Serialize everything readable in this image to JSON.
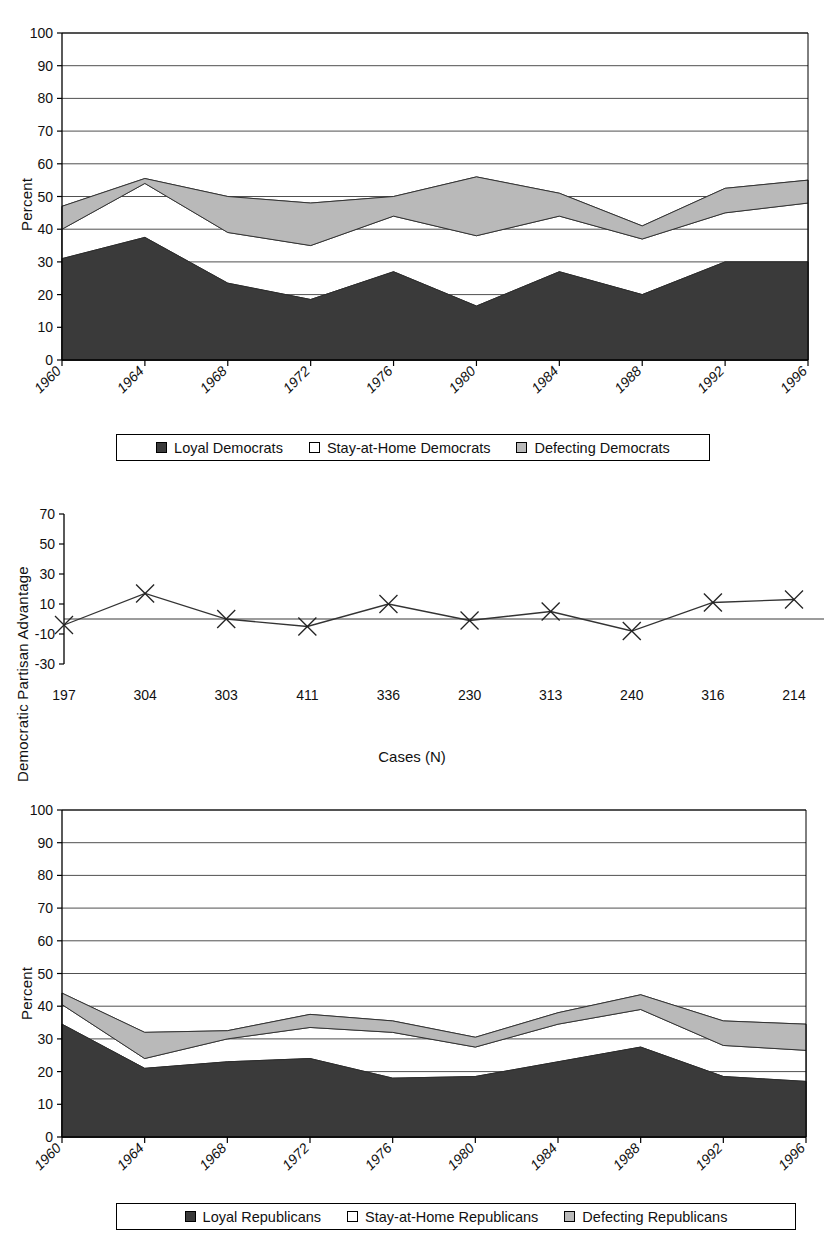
{
  "figure": {
    "background": "#ffffff",
    "colors": {
      "loyal": "#3a3a3a",
      "stay_at_home": "#ffffff",
      "defecting": "#b9b9b9",
      "axis": "#000000",
      "gridline": "#444444",
      "text": "#111111"
    }
  },
  "panel_democrats": {
    "y_axis_label": "Percent",
    "legend": {
      "items": [
        {
          "label": "Loyal Democrats",
          "swatch": "#3a3a3a",
          "icon": "filled-square-icon"
        },
        {
          "label": "Stay-at-Home Democrats",
          "swatch": "#ffffff",
          "icon": "empty-square-icon"
        },
        {
          "label": "Defecting Democrats",
          "swatch": "#b9b9b9",
          "icon": "gray-square-icon"
        }
      ]
    }
  },
  "panel_advantage": {
    "y_axis_label": "Democratic Partisan Advantage",
    "x_axis_label": "Cases (N)"
  },
  "panel_republicans": {
    "y_axis_label": "Percent",
    "legend": {
      "items": [
        {
          "label": "Loyal Republicans",
          "swatch": "#3a3a3a",
          "icon": "filled-square-icon"
        },
        {
          "label": "Stay-at-Home Republicans",
          "swatch": "#ffffff",
          "icon": "empty-square-icon"
        },
        {
          "label": "Defecting Republicans",
          "swatch": "#b9b9b9",
          "icon": "gray-square-icon"
        }
      ]
    }
  },
  "chart_data": [
    {
      "id": "democrats-composition",
      "type": "area",
      "stacked": true,
      "title": "",
      "xlabel": "",
      "ylabel": "Percent",
      "categories": [
        "1960",
        "1964",
        "1968",
        "1972",
        "1976",
        "1980",
        "1984",
        "1988",
        "1992",
        "1996"
      ],
      "ylim": [
        0,
        100
      ],
      "yticks": [
        0,
        10,
        20,
        30,
        40,
        50,
        60,
        70,
        80,
        90,
        100
      ],
      "grid": true,
      "legend_position": "bottom",
      "series": [
        {
          "name": "Loyal Democrats",
          "color": "#3a3a3a",
          "values": [
            31,
            37.5,
            23.5,
            18.5,
            27,
            16.5,
            27,
            20,
            30,
            30
          ]
        },
        {
          "name": "Stay-at-Home Democrats",
          "color": "#ffffff",
          "values": [
            9,
            16.5,
            15.5,
            16.5,
            17,
            21.5,
            17,
            17,
            15,
            18
          ]
        },
        {
          "name": "Defecting Democrats",
          "color": "#b9b9b9",
          "values": [
            7,
            1.5,
            11,
            13,
            6,
            18,
            7,
            4,
            7.5,
            7
          ]
        }
      ],
      "cumulative_tops": {
        "loyal": [
          31,
          37.5,
          23.5,
          18.5,
          27,
          16.5,
          27,
          20,
          30,
          30
        ],
        "stay_at_home": [
          40,
          54,
          39,
          35,
          44,
          38,
          44,
          37,
          45,
          48
        ],
        "defecting": [
          47,
          55.5,
          50,
          48,
          50,
          56,
          51,
          41,
          52.5,
          55
        ]
      }
    },
    {
      "id": "democratic-partisan-advantage",
      "type": "line",
      "title": "",
      "xlabel": "Cases (N)",
      "ylabel": "Democratic Partisan Advantage",
      "categories": [
        "197",
        "304",
        "303",
        "411",
        "336",
        "230",
        "313",
        "240",
        "316",
        "214"
      ],
      "ylim": [
        -30,
        70
      ],
      "yticks": [
        -30,
        -10,
        10,
        30,
        50,
        70
      ],
      "grid": false,
      "marker": "x",
      "zero_line": true,
      "series": [
        {
          "name": "Democratic Partisan Advantage",
          "color": "#333333",
          "values": [
            -4,
            17,
            0,
            -5,
            10,
            -1,
            5,
            -8,
            11,
            13
          ]
        }
      ]
    },
    {
      "id": "republicans-composition",
      "type": "area",
      "stacked": true,
      "title": "",
      "xlabel": "",
      "ylabel": "Percent",
      "categories": [
        "1960",
        "1964",
        "1968",
        "1972",
        "1976",
        "1980",
        "1984",
        "1988",
        "1992",
        "1996"
      ],
      "ylim": [
        0,
        100
      ],
      "yticks": [
        0,
        10,
        20,
        30,
        40,
        50,
        60,
        70,
        80,
        90,
        100
      ],
      "grid": true,
      "legend_position": "bottom",
      "series": [
        {
          "name": "Loyal Republicans",
          "color": "#3a3a3a",
          "values": [
            34.5,
            21,
            23,
            24,
            18,
            18.5,
            23,
            27.5,
            18.5,
            17
          ]
        },
        {
          "name": "Stay-at-Home Republicans",
          "color": "#ffffff",
          "values": [
            6,
            3,
            7,
            9.5,
            14,
            9,
            11.5,
            11.5,
            9.5,
            9.5
          ]
        },
        {
          "name": "Defecting Republicans",
          "color": "#b9b9b9",
          "values": [
            3.5,
            8,
            2.5,
            4,
            3.5,
            3,
            3.5,
            4.5,
            7.5,
            8
          ]
        }
      ],
      "cumulative_tops": {
        "loyal": [
          34.5,
          21,
          23,
          24,
          18,
          18.5,
          23,
          27.5,
          18.5,
          17
        ],
        "stay_at_home": [
          40.5,
          24,
          30,
          33.5,
          32,
          27.5,
          34.5,
          39,
          28,
          26.5
        ],
        "defecting": [
          44,
          32,
          32.5,
          37.5,
          35.5,
          30.5,
          38,
          43.5,
          35.5,
          34.5
        ]
      }
    }
  ]
}
